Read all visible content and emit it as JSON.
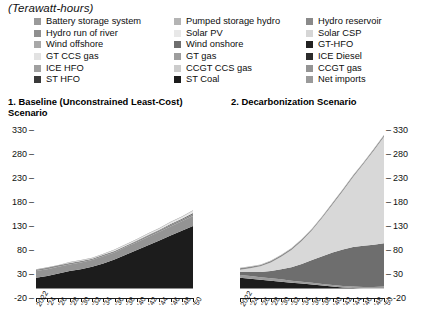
{
  "units_label": "(Terawatt-hours)",
  "legend": {
    "columns": [
      [
        {
          "label": "Battery storage system",
          "color": "#9a9a9a"
        },
        {
          "label": "Hydro run of river",
          "color": "#8f8f8f"
        },
        {
          "label": "Wind offshore",
          "color": "#a8a8a8"
        },
        {
          "label": "GT CCS gas",
          "color": "#e2e2e2"
        },
        {
          "label": "ICE HFO",
          "color": "#a0a0a0"
        },
        {
          "label": "ST HFO",
          "color": "#3a3a3a"
        }
      ],
      [
        {
          "label": "Pumped storage hydro",
          "color": "#b4b4b4"
        },
        {
          "label": "Solar PV",
          "color": "#e8e8e8"
        },
        {
          "label": "Wind onshore",
          "color": "#6e6e6e"
        },
        {
          "label": "GT gas",
          "color": "#9d9d9d"
        },
        {
          "label": "CCGT CCS gas",
          "color": "#cccccc"
        },
        {
          "label": "ST Coal",
          "color": "#1c1c1c"
        }
      ],
      [
        {
          "label": "Hydro reservoir",
          "color": "#8a8a8a"
        },
        {
          "label": "Solar CSP",
          "color": "#d6d6d6"
        },
        {
          "label": "GT-HFO",
          "color": "#222222"
        },
        {
          "label": "ICE Diesel",
          "color": "#2b2b2b"
        },
        {
          "label": "CCGT gas",
          "color": "#949494"
        },
        {
          "label": "Net imports",
          "color": "#9a9a9a"
        }
      ]
    ]
  },
  "panels": {
    "left_title": "1. Baseline (Unconstrained Least-Cost) Scenario",
    "right_title": "2. Decarbonization Scenario"
  },
  "axis": {
    "y_ticks": [
      "330",
      "280",
      "230",
      "180",
      "130",
      "80",
      "30",
      "-20"
    ],
    "y_min": -20,
    "y_max": 330,
    "x_labels": [
      "2022",
      "'24",
      "'26",
      "'28",
      "'30",
      "'32",
      "'34",
      "'36",
      "'38",
      "'40",
      "'42",
      "'44",
      "'46",
      "'48",
      "'50"
    ]
  },
  "chart_data": [
    {
      "type": "area",
      "title": "1. Baseline (Unconstrained Least-Cost) Scenario",
      "subtitle": "",
      "xlabel": "",
      "ylabel": "Terawatt-hours",
      "ylim": [
        -20,
        330
      ],
      "grid": false,
      "legend_position": "top",
      "stacked": true,
      "x": [
        2022,
        2024,
        2026,
        2028,
        2030,
        2032,
        2034,
        2036,
        2038,
        2040,
        2042,
        2044,
        2046,
        2048,
        2050
      ],
      "series": [
        {
          "name": "ST Coal",
          "color": "#1c1c1c",
          "values": [
            22,
            26,
            31,
            36,
            40,
            45,
            52,
            60,
            70,
            80,
            90,
            100,
            110,
            120,
            130
          ]
        },
        {
          "name": "CCGT gas",
          "color": "#949494",
          "values": [
            14,
            14,
            14,
            14,
            14,
            14,
            15,
            15,
            16,
            16,
            17,
            18,
            19,
            20,
            21
          ]
        },
        {
          "name": "Hydro reservoir",
          "color": "#8a8a8a",
          "values": [
            3,
            3,
            3,
            3,
            3,
            3,
            3,
            3,
            3,
            3,
            3,
            3,
            3,
            3,
            3
          ]
        },
        {
          "name": "Wind onshore",
          "color": "#6e6e6e",
          "values": [
            0,
            0,
            0,
            0,
            0,
            0,
            0,
            0,
            0,
            1,
            1,
            1,
            2,
            2,
            3
          ]
        },
        {
          "name": "Solar PV",
          "color": "#e8e8e8",
          "values": [
            0,
            0,
            0,
            1,
            1,
            1,
            1,
            2,
            2,
            2,
            3,
            3,
            4,
            4,
            5
          ]
        },
        {
          "name": "Net imports",
          "color": "#9a9a9a",
          "values": [
            1,
            1,
            1,
            1,
            1,
            1,
            1,
            1,
            1,
            1,
            1,
            1,
            1,
            1,
            1
          ]
        }
      ]
    },
    {
      "type": "area",
      "title": "2. Decarbonization Scenario",
      "subtitle": "",
      "xlabel": "",
      "ylabel": "Terawatt-hours",
      "ylim": [
        -20,
        330
      ],
      "grid": false,
      "legend_position": "top",
      "stacked": true,
      "x": [
        2022,
        2024,
        2026,
        2028,
        2030,
        2032,
        2034,
        2036,
        2038,
        2040,
        2042,
        2044,
        2046,
        2048,
        2050
      ],
      "series": [
        {
          "name": "ST Coal",
          "color": "#1c1c1c",
          "values": [
            22,
            20,
            18,
            16,
            14,
            12,
            10,
            8,
            6,
            4,
            2,
            1,
            0,
            0,
            0
          ]
        },
        {
          "name": "CCGT gas",
          "color": "#9b9b9b",
          "values": [
            6,
            6,
            5,
            5,
            5,
            4,
            4,
            4,
            3,
            3,
            3,
            3,
            3,
            3,
            4
          ]
        },
        {
          "name": "Wind onshore",
          "color": "#6e6e6e",
          "values": [
            6,
            8,
            11,
            15,
            21,
            28,
            37,
            47,
            58,
            68,
            76,
            82,
            86,
            88,
            90
          ]
        },
        {
          "name": "Solar PV",
          "color": "#d8d8d8",
          "values": [
            5,
            8,
            12,
            18,
            26,
            36,
            48,
            62,
            80,
            100,
            122,
            146,
            170,
            196,
            222
          ]
        },
        {
          "name": "Hydro reservoir",
          "color": "#8a8a8a",
          "values": [
            3,
            3,
            3,
            3,
            3,
            3,
            3,
            3,
            3,
            3,
            3,
            3,
            3,
            3,
            3
          ]
        },
        {
          "name": "Net imports",
          "color": "#b0b0b0",
          "values": [
            1,
            1,
            1,
            1,
            1,
            1,
            1,
            1,
            1,
            1,
            1,
            1,
            1,
            1,
            1
          ]
        }
      ]
    }
  ]
}
